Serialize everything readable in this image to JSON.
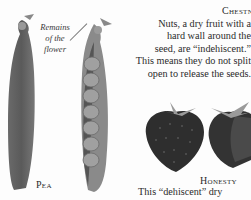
{
  "illustrations": {
    "pea_closed": "closed pea pod",
    "pea_open": "open pea pod showing seeds",
    "strawberry_whole": "whole strawberry",
    "strawberry_cut": "cut strawberry"
  },
  "annotation": {
    "line1": "Remains",
    "line2": "of the",
    "line3": "flower"
  },
  "pea": {
    "label": "Pea"
  },
  "chestnut": {
    "label": "Chestnut",
    "lines": [
      "Nuts, a dry fruit with a",
      "hard wall around the",
      "seed, are “indehiscent.”",
      "This means they do not split",
      "open to release the seeds."
    ]
  },
  "honesty": {
    "label": "Honesty",
    "text": "This “dehiscent” dry"
  },
  "colors": {
    "page": "#fdfdfd",
    "text": "#2b2b2b",
    "pod_dark": "#5a5a5a",
    "pod_light": "#8a8a8a",
    "pea_seed": "#9a9a9a",
    "berry": "#2e2e2e"
  }
}
